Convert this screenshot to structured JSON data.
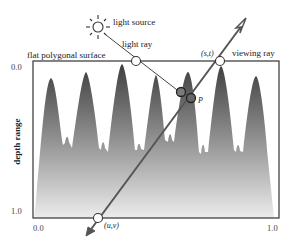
{
  "labels": {
    "light_source": "light source",
    "light_ray": "light ray",
    "flat_surface": "flat polygonal surface",
    "viewing_ray": "viewing ray",
    "point_st": "(s,t)",
    "point_uv": "(u,v)",
    "point_p": "P",
    "y_axis": "depth range"
  },
  "ticks": {
    "y_top": "0.0",
    "y_bottom": "1.0",
    "x_left": "0.0",
    "x_right": "1.0"
  },
  "colors": {
    "frame": "#333333",
    "ray": "#555555",
    "relief_dark": "#4a4a4a",
    "relief_light": "#e6e6e6",
    "marker_fill": "#777777"
  }
}
